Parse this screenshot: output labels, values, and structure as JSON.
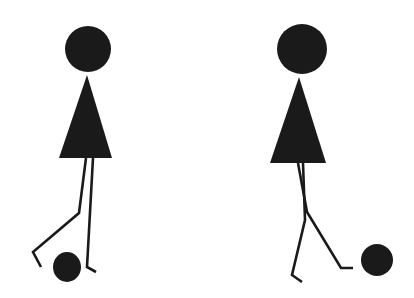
{
  "scene": {
    "width": 414,
    "height": 298,
    "background": "#ffffff",
    "ink": "#1a1a1a",
    "figures": [
      {
        "name": "figure-left",
        "head": {
          "cx": 88,
          "cy": 49,
          "r": 23
        },
        "body": {
          "apex": [
            87,
            75
          ],
          "base_left": [
            59,
            158
          ],
          "base_right": [
            112,
            158
          ]
        },
        "legs": [
          {
            "points": [
              [
                86,
                158
              ],
              [
                79,
                213
              ],
              [
                33,
                252
              ],
              [
                41,
                267
              ]
            ]
          },
          {
            "points": [
              [
                93,
                158
              ],
              [
                87,
                267
              ],
              [
                96,
                272
              ]
            ]
          }
        ],
        "ball": {
          "cx": 67,
          "cy": 267,
          "rx": 14,
          "ry": 15
        }
      },
      {
        "name": "figure-right",
        "head": {
          "cx": 302,
          "cy": 49,
          "r": 25
        },
        "body": {
          "apex": [
            299,
            77
          ],
          "base_left": [
            270,
            163
          ],
          "base_right": [
            326,
            163
          ]
        },
        "legs": [
          {
            "points": [
              [
                298,
                163
              ],
              [
                307,
                212
              ],
              [
                341,
                268
              ],
              [
                353,
                268
              ]
            ]
          },
          {
            "points": [
              [
                303,
                163
              ],
              [
                305,
                220
              ],
              [
                292,
                275
              ],
              [
                302,
                282
              ]
            ]
          }
        ],
        "ball": {
          "cx": 377,
          "cy": 260,
          "rx": 16,
          "ry": 16
        }
      }
    ]
  }
}
